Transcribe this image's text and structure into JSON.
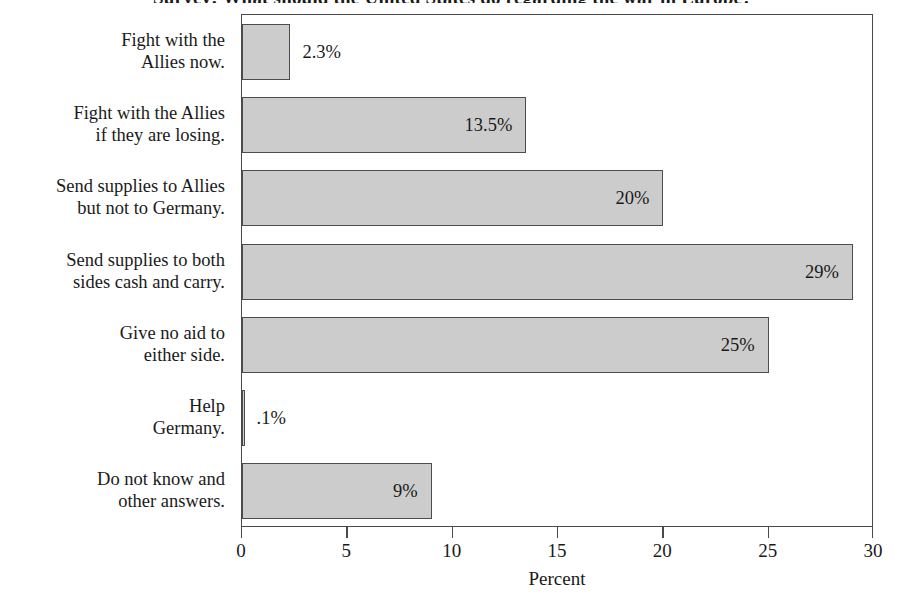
{
  "chart_data": {
    "type": "bar",
    "orientation": "horizontal",
    "title": "Survey: What should the United States do regarding the war in Europe?",
    "title_visible": false,
    "xlabel": "Percent",
    "ylabel": "",
    "xlim": [
      0,
      30
    ],
    "xticks": [
      0,
      5,
      10,
      15,
      20,
      25,
      30
    ],
    "xtick_labels": [
      "0",
      "5",
      "10",
      "15",
      "20",
      "25",
      "30"
    ],
    "grid": false,
    "legend": false,
    "bar_fill_color": "#cccccc",
    "bar_edge_color": "#4d4d4d",
    "frame_color": "#4a4a4a",
    "categories": [
      "Fight with the\nAllies now.",
      "Fight with the Allies\nif they are losing.",
      "Send supplies to Allies\nbut not to Germany.",
      "Send supplies to both\nsides cash and carry.",
      "Give no aid to\neither side.",
      "Help\nGermany.",
      "Do not know and\nother answers."
    ],
    "values": [
      2.3,
      13.5,
      20,
      29,
      25,
      0.1,
      9
    ],
    "value_labels": [
      "2.3%",
      "13.5%",
      "20%",
      "29%",
      "25%",
      ".1%",
      "9%"
    ],
    "label_placement": [
      "outside",
      "inside",
      "inside",
      "inside",
      "inside",
      "outside",
      "inside"
    ]
  }
}
